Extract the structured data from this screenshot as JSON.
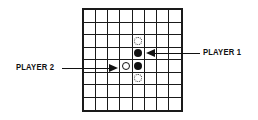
{
  "board": {
    "columns": 8,
    "rows": 8,
    "pieces": [
      {
        "row": 2,
        "col": 4,
        "type": "hint"
      },
      {
        "row": 3,
        "col": 4,
        "type": "black"
      },
      {
        "row": 4,
        "col": 3,
        "type": "white"
      },
      {
        "row": 4,
        "col": 4,
        "type": "black"
      },
      {
        "row": 5,
        "col": 4,
        "type": "hint"
      }
    ]
  },
  "labels": {
    "player1": "PLAYER 1",
    "player2": "PLAYER 2"
  },
  "colors": {
    "grid": "#1a1a1a",
    "black_piece": "#111111",
    "white_piece": "#ffffff",
    "text": "#111111"
  }
}
